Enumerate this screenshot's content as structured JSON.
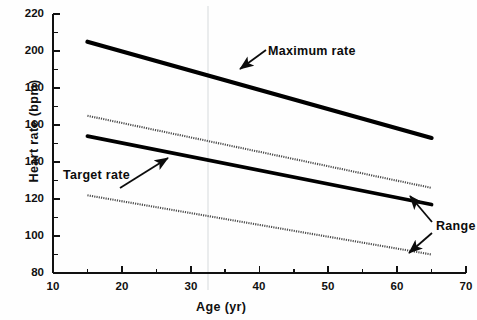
{
  "chart_data": {
    "type": "line",
    "title": "",
    "xlabel": "Age (yr)",
    "ylabel": "Heart rate (bpm)",
    "xlim": [
      10,
      70
    ],
    "ylim": [
      80,
      220
    ],
    "xticks": [
      10,
      20,
      30,
      40,
      50,
      60,
      70
    ],
    "yticks": [
      80,
      100,
      120,
      140,
      160,
      180,
      200,
      220
    ],
    "xtick_labels": [
      "10",
      "20",
      "30",
      "40",
      "50",
      "60",
      "70"
    ],
    "ytick_labels": [
      "80",
      "100",
      "120",
      "140",
      "160",
      "180",
      "200",
      "220"
    ],
    "x_minor_step": 5,
    "y_minor_step": 10,
    "grid": false,
    "legend": "none",
    "x": [
      15,
      65
    ],
    "series": [
      {
        "name": "Maximum rate",
        "style": "solid-bold",
        "color": "#000000",
        "values": [
          205,
          153
        ]
      },
      {
        "name": "Range upper",
        "style": "dotted",
        "color": "#555555",
        "values": [
          165,
          126
        ]
      },
      {
        "name": "Target rate",
        "style": "solid-bold",
        "color": "#000000",
        "values": [
          154,
          117
        ]
      },
      {
        "name": "Range lower",
        "style": "dotted",
        "color": "#555555",
        "values": [
          122,
          90
        ]
      }
    ],
    "annotations": [
      {
        "text": "Maximum rate",
        "points_to_series": "Maximum rate",
        "arrow": "down-left"
      },
      {
        "text": "Target rate",
        "points_to_series": "Target rate",
        "arrow": "up-right"
      },
      {
        "text": "Range",
        "points_to_series": "Range upper and Range lower",
        "arrow": "double"
      }
    ]
  },
  "axis": {
    "y_title": "Heart rate (bpm)",
    "x_title": "Age (yr)"
  },
  "annotations": {
    "maximum_rate": "Maximum rate",
    "target_rate": "Target rate",
    "range": "Range"
  },
  "colors": {
    "line": "#000000",
    "dotted": "#555555",
    "axis": "#111111",
    "background": "#fefefe"
  }
}
